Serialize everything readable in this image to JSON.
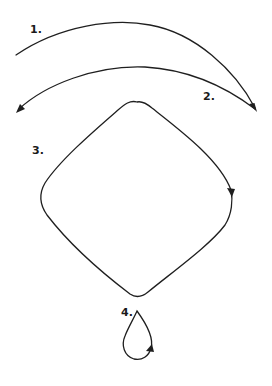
{
  "diagram": {
    "type": "motion-paths",
    "stroke_color": "#1f1f1f",
    "background": "#ffffff",
    "items": [
      {
        "label": "1.",
        "shape": "arc",
        "direction": "left-to-right, arrow at right end"
      },
      {
        "label": "2.",
        "shape": "arc",
        "direction": "right-to-left, arrow at left end"
      },
      {
        "label": "3.",
        "shape": "rounded-diamond loop",
        "direction": "clockwise, arrow on right side pointing down"
      },
      {
        "label": "4.",
        "shape": "teardrop loop",
        "direction": "counter-clockwise, arrow at lower right"
      }
    ]
  }
}
